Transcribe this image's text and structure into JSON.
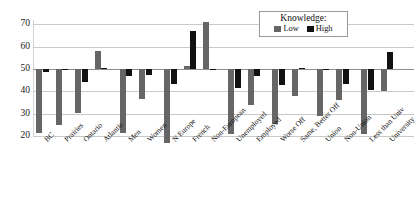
{
  "chart_data": {
    "type": "bar",
    "title": "",
    "subtitle": "",
    "xlabel": "",
    "ylabel": "",
    "ylim": [
      20,
      72
    ],
    "yticks": [
      20,
      30,
      40,
      50,
      60,
      70
    ],
    "baseline": 50,
    "grid": true,
    "legend_position": "top-right",
    "legend_title": "Knowledge:",
    "categories": [
      "BC",
      "Prairies",
      "Ontario",
      "Atlantic",
      "Men",
      "Women",
      "N Europe",
      "French",
      "Non-European",
      "Unemployed",
      "Employed",
      "Worse Off",
      "Same, Better Off",
      "Union",
      "Non-Union",
      "Less than Univ",
      "University"
    ],
    "group_breaks": [
      4,
      6,
      9,
      11,
      13,
      15
    ],
    "series": [
      {
        "name": "Low",
        "color": "#666666",
        "values": [
          21.5,
          25.0,
          30.5,
          58.0,
          21.5,
          36.5,
          17.0,
          51.5,
          71.0,
          21.0,
          34.0,
          25.5,
          38.0,
          29.0,
          36.0,
          21.0,
          40.0
        ]
      },
      {
        "name": "High",
        "color": "#111111",
        "values": [
          48.5,
          49.5,
          44.0,
          50.5,
          47.0,
          47.5,
          43.5,
          67.0,
          50.0,
          41.5,
          47.0,
          43.0,
          50.5,
          49.5,
          43.5,
          40.5,
          57.5
        ]
      }
    ]
  },
  "legend": {
    "title": "Knowledge:",
    "items": [
      {
        "label": "Low",
        "color": "#666666"
      },
      {
        "label": "High",
        "color": "#111111"
      }
    ]
  },
  "axis": {
    "y_ticks": [
      "70",
      "60",
      "50",
      "40",
      "30",
      "20"
    ]
  }
}
